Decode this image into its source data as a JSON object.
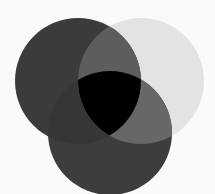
{
  "diagram": {
    "type": "venn",
    "set_count": 3,
    "background": "#fafafa",
    "circles": [
      {
        "id": "left",
        "cx": 78,
        "cy": 81,
        "r": 63,
        "fill": "#3b3b3b"
      },
      {
        "id": "right",
        "cx": 141,
        "cy": 81,
        "r": 63,
        "fill": "#e3e3e3"
      },
      {
        "id": "bottom",
        "cx": 110,
        "cy": 133,
        "r": 62,
        "fill": "#3d3d3d"
      }
    ],
    "overlaps": {
      "left_right": "#5d5d5d",
      "right_bottom": "#676767",
      "left_bottom": "#363636",
      "all_three": "#000000"
    }
  }
}
